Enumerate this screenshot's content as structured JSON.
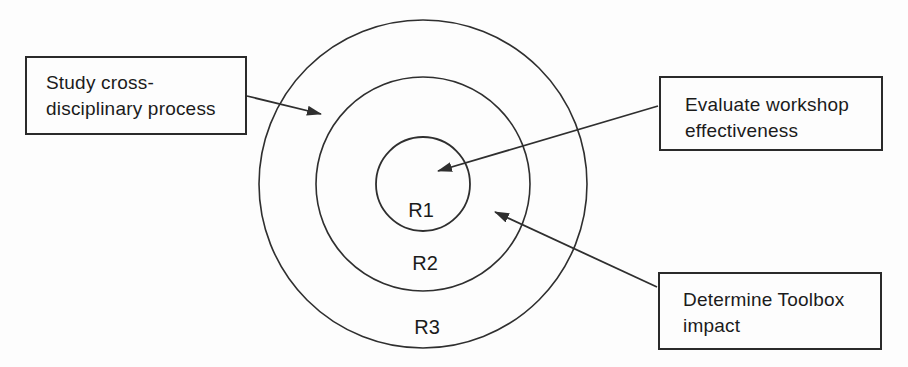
{
  "colors": {
    "line": "#2f2f2f",
    "text": "#1b1b1b",
    "background": "#fdfdfd",
    "box_border": "#2a2a2a"
  },
  "rings": {
    "inner": {
      "label": "R1"
    },
    "middle": {
      "label": "R2"
    },
    "outer": {
      "label": "R3"
    }
  },
  "callouts": {
    "study": {
      "line1": "Study cross-",
      "line2": "disciplinary process"
    },
    "evaluate": {
      "line1": "Evaluate workshop",
      "line2": "effectiveness"
    },
    "toolbox": {
      "line1": "Determine Toolbox",
      "line2": "impact"
    }
  }
}
